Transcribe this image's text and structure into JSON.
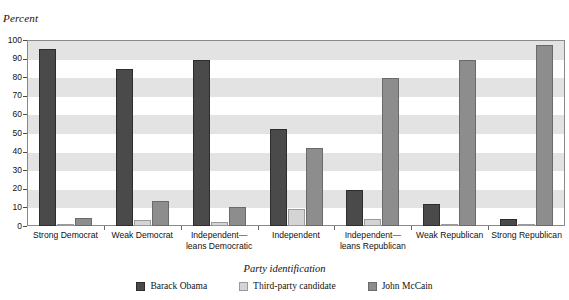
{
  "figure": {
    "y_axis_title": "Percent",
    "x_axis_title": "Party identification"
  },
  "legend": {
    "position": "bottom-center",
    "items": [
      {
        "label": "Barack Obama",
        "color": "#4a4a4a",
        "swatch": "legend-swatch-obama"
      },
      {
        "label": "Third-party candidate",
        "color": "#d4d4d4",
        "swatch": "legend-swatch-third-party"
      },
      {
        "label": "John McCain",
        "color": "#8d8d8d",
        "swatch": "legend-swatch-mccain"
      }
    ]
  },
  "chart_data": {
    "type": "bar",
    "title": "",
    "subtitle": "",
    "xlabel": "Party identification",
    "ylabel": "Percent",
    "ylim": [
      0,
      100
    ],
    "yticks": [
      0,
      10,
      20,
      30,
      40,
      50,
      60,
      70,
      80,
      90,
      100
    ],
    "ytick_labels": [
      "0",
      "10",
      "20",
      "30",
      "40",
      "50",
      "60",
      "70",
      "80",
      "90",
      "100"
    ],
    "grid": "alternating horizontal bands",
    "legend_position": "bottom",
    "categories": [
      "Strong Democrat",
      "Weak Democrat",
      "Independent—leans Democratic",
      "Independent",
      "Independent—leans Republican",
      "Weak Republican",
      "Strong Republican"
    ],
    "category_lines": [
      [
        "Strong Democrat"
      ],
      [
        "Weak Democrat"
      ],
      [
        "Independent—",
        "leans Democratic"
      ],
      [
        "Independent"
      ],
      [
        "Independent—",
        "leans Republican"
      ],
      [
        "Weak Republican"
      ],
      [
        "Strong Republican"
      ]
    ],
    "series": [
      {
        "name": "Barack Obama",
        "color": "#4a4a4a",
        "values": [
          95,
          84.5,
          89.5,
          52,
          19.5,
          12,
          4
        ]
      },
      {
        "name": "Third-party candidate",
        "color": "#d4d4d4",
        "values": [
          1,
          3,
          2,
          9,
          4,
          1,
          0.5
        ]
      },
      {
        "name": "John McCain",
        "color": "#8d8d8d",
        "values": [
          4.5,
          13.5,
          10,
          42,
          79.5,
          89,
          97.5
        ]
      }
    ]
  }
}
